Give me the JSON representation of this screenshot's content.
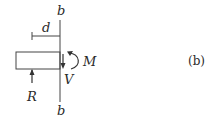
{
  "figure": {
    "panel_label": "(b)",
    "section_labels": {
      "top": "b",
      "bottom": "b"
    },
    "dimension_label": "d",
    "moment_label": "M",
    "shear_label": "V",
    "reaction_label": "R"
  },
  "colors": {
    "ink": "#2a2a2a",
    "background": "#ffffff"
  }
}
